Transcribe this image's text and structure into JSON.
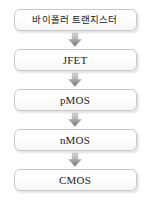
{
  "diagram": {
    "orientation": "vertical-top-to-bottom",
    "background_color": "#ffffff",
    "box_border_color": "#c9c9c9",
    "box_fill_color": "#fdfdfd",
    "text_color": "#1c1c1c",
    "arrow_color": "#8a8a8a",
    "nodes": [
      {
        "id": "node-1",
        "label": "바이폴러 트랜지스터",
        "script": "korean"
      },
      {
        "id": "node-2",
        "label": "JFET",
        "script": "latin"
      },
      {
        "id": "node-3",
        "label": "pMOS",
        "script": "latin"
      },
      {
        "id": "node-4",
        "label": "nMOS",
        "script": "latin"
      },
      {
        "id": "node-5",
        "label": "CMOS",
        "script": "latin"
      }
    ],
    "connectors": [
      {
        "id": "arrow-1",
        "icon": "arrow-down-icon",
        "from": "node-1",
        "to": "node-2"
      },
      {
        "id": "arrow-2",
        "icon": "arrow-down-icon",
        "from": "node-2",
        "to": "node-3"
      },
      {
        "id": "arrow-3",
        "icon": "arrow-down-icon",
        "from": "node-3",
        "to": "node-4"
      },
      {
        "id": "arrow-4",
        "icon": "arrow-down-icon",
        "from": "node-4",
        "to": "node-5"
      }
    ]
  }
}
